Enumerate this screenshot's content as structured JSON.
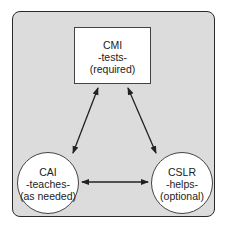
{
  "diagram": {
    "nodes": [
      {
        "id": "cmi",
        "title": "CMI",
        "role": "-tests-",
        "note": "(required)",
        "shape": "rectangle"
      },
      {
        "id": "cai",
        "title": "CAI",
        "role": "-teaches-",
        "note": "(as needed)",
        "shape": "circle"
      },
      {
        "id": "cslr",
        "title": "CSLR",
        "role": "-helps-",
        "note": "(optional)",
        "shape": "circle"
      }
    ],
    "edges": [
      {
        "from": "cmi",
        "to": "cai",
        "direction": "bidirectional"
      },
      {
        "from": "cmi",
        "to": "cslr",
        "direction": "bidirectional"
      },
      {
        "from": "cai",
        "to": "cslr",
        "direction": "bidirectional"
      }
    ],
    "colors": {
      "background": "#dcdcdc",
      "node_fill": "#ffffff",
      "stroke": "#222222"
    }
  }
}
